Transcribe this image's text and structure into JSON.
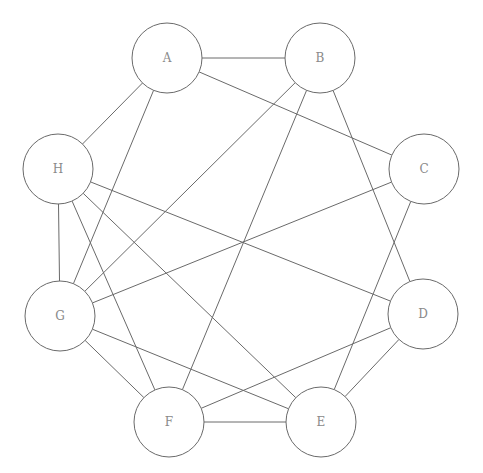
{
  "diagram": {
    "type": "undirected-graph",
    "colors": {
      "line": "#6a6a6a",
      "label": "#8a8a8a",
      "background": "#ffffff",
      "node_fill": "#ffffff"
    },
    "node_radius": 35,
    "nodes": [
      {
        "id": "A",
        "label": "A",
        "x": 167,
        "y": 58
      },
      {
        "id": "B",
        "label": "B",
        "x": 320,
        "y": 58
      },
      {
        "id": "C",
        "label": "C",
        "x": 424,
        "y": 169
      },
      {
        "id": "D",
        "label": "D",
        "x": 423,
        "y": 314
      },
      {
        "id": "E",
        "label": "E",
        "x": 321,
        "y": 422
      },
      {
        "id": "F",
        "label": "F",
        "x": 169,
        "y": 422
      },
      {
        "id": "G",
        "label": "G",
        "x": 60,
        "y": 316
      },
      {
        "id": "H",
        "label": "H",
        "x": 58,
        "y": 169
      }
    ],
    "edges": [
      [
        "A",
        "B"
      ],
      [
        "A",
        "C"
      ],
      [
        "A",
        "H"
      ],
      [
        "A",
        "G"
      ],
      [
        "B",
        "G"
      ],
      [
        "B",
        "F"
      ],
      [
        "B",
        "D"
      ],
      [
        "H",
        "G"
      ],
      [
        "H",
        "F"
      ],
      [
        "H",
        "E"
      ],
      [
        "H",
        "D"
      ],
      [
        "C",
        "G"
      ],
      [
        "C",
        "E"
      ],
      [
        "G",
        "F"
      ],
      [
        "G",
        "E"
      ],
      [
        "D",
        "F"
      ],
      [
        "D",
        "E"
      ],
      [
        "F",
        "E"
      ]
    ]
  }
}
